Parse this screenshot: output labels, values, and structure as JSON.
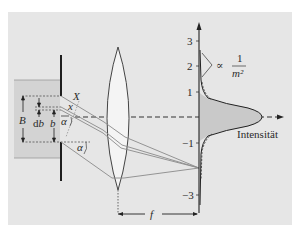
{
  "colors": {
    "panel": "#e6e6e6",
    "slab": "#d3d3d3",
    "ink": "#2a2a2a",
    "ray": "#8a8a8a",
    "fill_intensity": "#c9c9c9",
    "lens_fill": "#f4f4f4"
  },
  "labels": {
    "B": "B",
    "db": "d",
    "db_b": "b",
    "b": "b",
    "X": "X",
    "x": "x",
    "alpha_bar": "α",
    "alpha": "α",
    "f": "f",
    "intensity": "Intensität",
    "proportional": "∝",
    "frac_num": "1",
    "frac_den": "m²"
  },
  "axis": {
    "ticks": [
      {
        "value": "3",
        "y": 41
      },
      {
        "value": "2",
        "y": 66
      },
      {
        "value": "1",
        "y": 92
      },
      {
        "value": "−1",
        "y": 143
      },
      {
        "value": "−3",
        "y": 195
      }
    ]
  }
}
